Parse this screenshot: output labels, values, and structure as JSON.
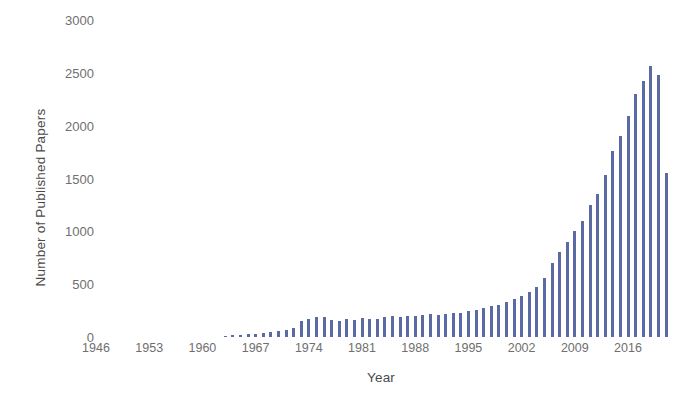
{
  "chart_data": {
    "type": "bar",
    "title": "",
    "xlabel": "Year",
    "ylabel": "Number of Published Papers",
    "ylim": [
      0,
      3000
    ],
    "yticks": [
      0,
      500,
      1000,
      1500,
      2000,
      2500,
      3000
    ],
    "xticks": [
      1946,
      1953,
      1960,
      1967,
      1974,
      1981,
      1988,
      1995,
      2002,
      2009,
      2016
    ],
    "xlim": [
      1946,
      2021
    ],
    "grid": false,
    "legend": null,
    "bar_color": "#5b6aa4",
    "axis_text_color": "#6f6f6f",
    "categories": [
      1963,
      1964,
      1965,
      1966,
      1967,
      1968,
      1969,
      1970,
      1971,
      1972,
      1973,
      1974,
      1975,
      1976,
      1977,
      1978,
      1979,
      1980,
      1981,
      1982,
      1983,
      1984,
      1985,
      1986,
      1987,
      1988,
      1989,
      1990,
      1991,
      1992,
      1993,
      1994,
      1995,
      1996,
      1997,
      1998,
      1999,
      2000,
      2001,
      2002,
      2003,
      2004,
      2005,
      2006,
      2007,
      2008,
      2009,
      2010,
      2011,
      2012,
      2013,
      2014,
      2015,
      2016,
      2017,
      2018,
      2019,
      2020
    ],
    "values": [
      10,
      15,
      20,
      25,
      30,
      35,
      45,
      55,
      70,
      90,
      150,
      175,
      190,
      185,
      160,
      150,
      175,
      165,
      180,
      170,
      175,
      185,
      195,
      185,
      200,
      195,
      210,
      215,
      205,
      215,
      230,
      225,
      245,
      255,
      275,
      295,
      300,
      330,
      360,
      390,
      430,
      470,
      560,
      700,
      800,
      900,
      1000,
      1100,
      1250,
      1350,
      1530,
      1760,
      1900,
      2090,
      2300,
      2420,
      2565,
      2480
    ],
    "last_partial_value": 1550
  }
}
